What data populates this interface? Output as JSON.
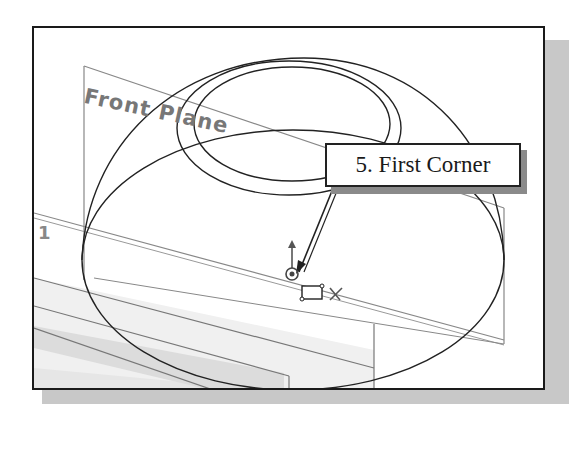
{
  "viewport": {
    "plane_label": "Front Plane",
    "secondary_plane_label": "1"
  },
  "callout": {
    "step_label": "5. First Corner"
  },
  "icons": {
    "origin": "origin-icon",
    "rectangle_cursor": "rectangle-cursor-icon",
    "snap": "intersection-snap-icon"
  },
  "colors": {
    "frame_border": "#1a1a1a",
    "shadow": "#c8c8c8",
    "geometry": "#2a2a2a",
    "plane": "#888888",
    "plane_fill": "#eeeeee"
  }
}
